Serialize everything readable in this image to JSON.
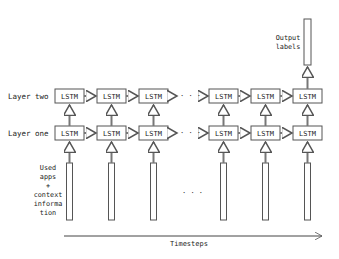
{
  "diagram": {
    "layer_labels": [
      "Layer two",
      "Layer one"
    ],
    "cell_label": "LSTM",
    "columns": [
      {
        "x": 55
      },
      {
        "x": 97
      },
      {
        "x": 139
      },
      {
        "x": 209
      },
      {
        "x": 251
      },
      {
        "x": 293
      }
    ],
    "ellipsis": "· · ·",
    "input_label": [
      "Used",
      "apps",
      "+",
      "context",
      "informa",
      "tion"
    ],
    "output_label": [
      "Output",
      "labels"
    ],
    "axis_label": "Timesteps",
    "colors": {
      "stroke": "#555555",
      "text": "#222222",
      "background": "#ffffff"
    }
  }
}
